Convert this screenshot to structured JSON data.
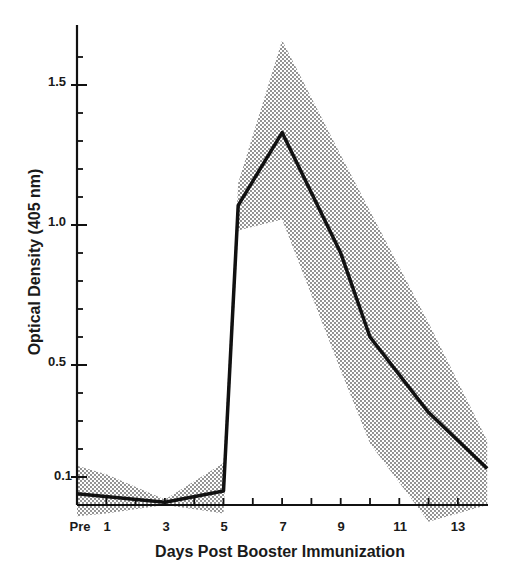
{
  "chart_data": {
    "type": "line",
    "title": "",
    "xlabel": "Days Post Booster Immunization",
    "ylabel": "Optical Density (405 nm)",
    "x_tick_labels": [
      "Pre",
      "1",
      "3",
      "5",
      "7",
      "9",
      "11",
      "13"
    ],
    "y_tick_labels": [
      "0.1",
      "0.5",
      "1.0",
      "1.5"
    ],
    "y_ticks": [
      0.1,
      0.5,
      1.0,
      1.5
    ],
    "ylim": [
      0.0,
      1.7
    ],
    "xlim": [
      0,
      14
    ],
    "grid": false,
    "legend": null,
    "series": [
      {
        "name": "Mean optical density",
        "x": [
          0,
          3,
          5,
          5.5,
          7,
          9,
          10,
          12,
          14
        ],
        "values": [
          0.04,
          0.01,
          0.05,
          1.07,
          1.33,
          0.9,
          0.6,
          0.33,
          0.13
        ],
        "color": "#111111"
      }
    ],
    "band": {
      "name": "Range (shaded region)",
      "x": [
        0,
        1,
        3,
        5,
        5.5,
        7,
        9,
        10,
        12,
        14
      ],
      "upper": [
        0.14,
        0.11,
        0.02,
        0.15,
        1.15,
        1.66,
        1.25,
        1.05,
        0.65,
        0.23
      ],
      "lower": [
        -0.04,
        -0.03,
        0.0,
        -0.03,
        0.98,
        1.02,
        0.48,
        0.22,
        -0.06,
        0.0
      ],
      "pattern": "stipple",
      "color": "#555555"
    }
  }
}
